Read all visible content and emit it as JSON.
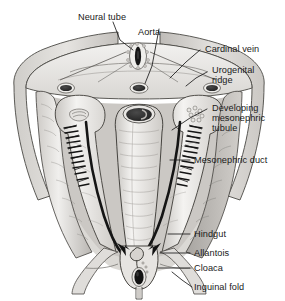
{
  "figure": {
    "type": "anatomical-illustration",
    "style": "grayscale pen-and-ink textbook drawing",
    "background_color": "#ffffff",
    "line_color": "#1a1a1a",
    "fill_light": "#efeeec",
    "fill_mid": "#d5d3d0",
    "fill_dark": "#b4b1ad",
    "fill_darker": "#8f8c88",
    "lumen_dark": "#2b2b2b"
  },
  "labels": {
    "neural_tube": "Neural tube",
    "aorta": "Aorta",
    "cardinal_vein": "Cardinal vein",
    "urogenital_ridge_line1": "Urogenital",
    "urogenital_ridge_line2": "ridge",
    "developing_tubule_line1": "Developing",
    "developing_tubule_line2": "mesonephric",
    "developing_tubule_line3": "tubule",
    "mesonephric_duct": "Mesonephric duct",
    "hindgut": "Hindgut",
    "allantois": "Allantois",
    "cloaca": "Cloaca",
    "inguinal_fold": "Inguinal fold"
  },
  "structures": [
    {
      "name": "neural-tube",
      "description": "dark vertical oval in dorsal midline at top"
    },
    {
      "name": "aorta",
      "description": "dark oval lumen in midline below neural tube"
    },
    {
      "name": "cardinal-vein",
      "description": "dark oval lumen lateral to aorta, both sides"
    },
    {
      "name": "urogenital-ridge",
      "description": "paired longitudinal ridges flanking the midline"
    },
    {
      "name": "developing-mesonephric-tubule",
      "description": "zigzag tubule bundles within each ridge"
    },
    {
      "name": "mesonephric-duct",
      "description": "dark longitudinal band running caudally in each ridge"
    },
    {
      "name": "hindgut",
      "description": "large central tube with dark oval lumen"
    },
    {
      "name": "allantois",
      "description": "small irregular diverticulum at caudal midline"
    },
    {
      "name": "cloaca",
      "description": "dark ovoid cavity at caudal end"
    },
    {
      "name": "inguinal-fold",
      "description": "lateral fold extending from caudal body wall"
    }
  ],
  "arrows": [
    {
      "name": "left-duct-arrow",
      "description": "arrowhead showing caudal flow of left mesonephric duct toward cloaca"
    },
    {
      "name": "right-duct-arrow",
      "description": "arrowhead showing caudal flow of right mesonephric duct toward cloaca"
    }
  ]
}
